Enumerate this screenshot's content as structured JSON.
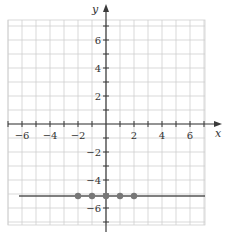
{
  "chart_data": {
    "type": "line",
    "title": "",
    "xlabel": "x",
    "ylabel": "y",
    "xlim": [
      -7,
      7
    ],
    "ylim": [
      -7,
      7
    ],
    "grid": true,
    "x_ticks": [
      -6,
      -4,
      -2,
      2,
      4,
      6
    ],
    "y_ticks": [
      -6,
      -4,
      -2,
      2,
      4,
      6
    ],
    "x_tick_labels": [
      "−6",
      "−4",
      "−2",
      "2",
      "4",
      "6"
    ],
    "y_tick_labels": [
      "−6",
      "−4",
      "−2",
      "2",
      "4",
      "6"
    ],
    "series": [
      {
        "name": "y = -5",
        "kind": "horizontal-line",
        "y": -5,
        "x_range": [
          -6.5,
          7
        ]
      },
      {
        "name": "points",
        "kind": "scatter",
        "x": [
          -2,
          -1,
          0,
          1,
          2
        ],
        "y": [
          -5,
          -5,
          -5,
          -5,
          -5
        ]
      }
    ],
    "colors": {
      "grid": "#cfcfcf",
      "axis": "#3a3a3a",
      "line": "#555555",
      "points": "#777777"
    }
  }
}
